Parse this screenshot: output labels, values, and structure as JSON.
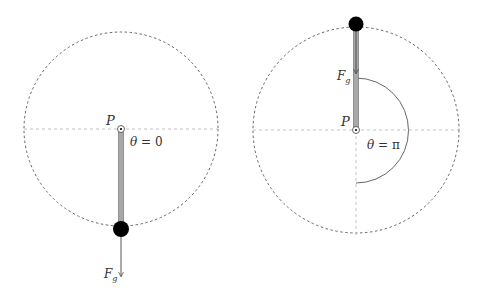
{
  "diagrams": [
    {
      "id": "left",
      "pivot_label": "P",
      "angle_label_var": "θ",
      "angle_label_eq": " = 0",
      "force_label_main": "F",
      "force_label_sub": "g"
    },
    {
      "id": "right",
      "pivot_label": "P",
      "angle_label_var": "θ",
      "angle_label_eq": " = π",
      "force_label_main": "F",
      "force_label_sub": "g"
    }
  ],
  "colors": {
    "circle": "#555555",
    "axis": "#bbbbbb",
    "rod": "#999999",
    "rod_edge": "#555555",
    "bob": "#000000",
    "arrow": "#444444",
    "arc": "#555555"
  }
}
